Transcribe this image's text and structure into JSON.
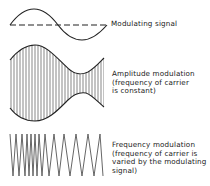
{
  "diagram": {
    "modulating": {
      "label": "Modulating signal"
    },
    "am": {
      "lines": [
        "Amplitude modulation",
        "(frequency of carrier",
        "is constant)"
      ]
    },
    "fm": {
      "lines": [
        "Frequency modulation",
        "(frequency of carrier is",
        "varied by the modulating",
        "signal)"
      ]
    },
    "colors": {
      "stroke": "#222222",
      "carrier": "#555555",
      "background": "#ffffff"
    }
  }
}
